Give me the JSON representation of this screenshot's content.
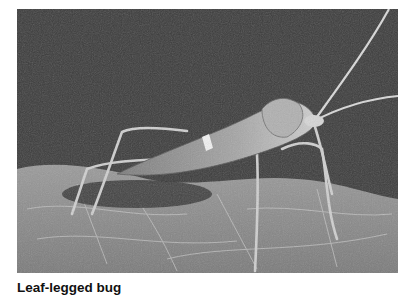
{
  "figure": {
    "caption": "Leaf-legged bug",
    "image_subject": "leaf-legged bug on a leaf",
    "image_style": "grayscale photograph"
  }
}
